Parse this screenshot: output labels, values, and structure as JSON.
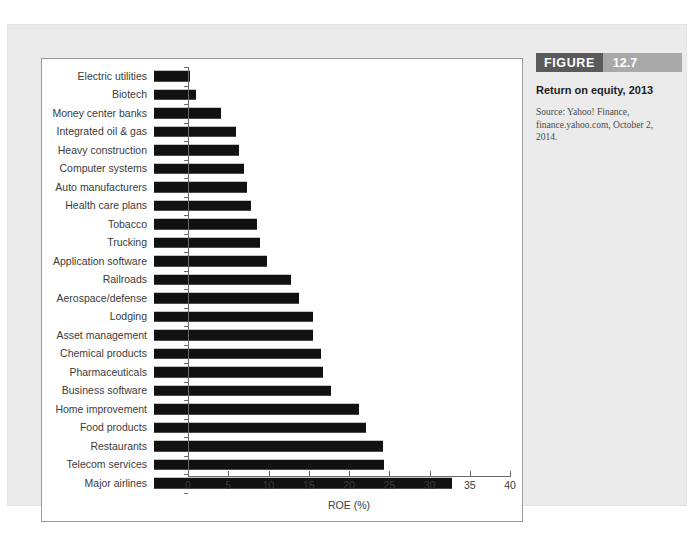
{
  "page": {
    "header_bleed": "",
    "folio": ""
  },
  "caption": {
    "badge_word": "FIGURE",
    "badge_number": "12.7",
    "title": "Return on equity, 2013",
    "source": "Source: Yahoo! Finance, finance.yahoo.com, October 2, 2014."
  },
  "colors": {
    "bar": "#111111",
    "panel_bg": "#ebebeb",
    "card_bg": "#ffffff",
    "badge_word_bg": "#5a5a5a",
    "badge_num_bg": "#a9a9a9",
    "axis": "#6a6a6a",
    "text": "#3b3b3b"
  },
  "chart_data": {
    "type": "bar",
    "orientation": "horizontal",
    "title": "Return on equity, 2013",
    "xlabel": "ROE (%)",
    "ylabel": "",
    "xlim": [
      0,
      40
    ],
    "xticks": [
      0,
      5,
      10,
      15,
      20,
      25,
      30,
      35,
      40
    ],
    "grid": false,
    "legend": false,
    "categories": [
      "Electric utilities",
      "Biotech",
      "Money center banks",
      "Integrated oil & gas",
      "Heavy construction",
      "Computer systems",
      "Auto manufacturers",
      "Health care plans",
      "Tobacco",
      "Trucking",
      "Application software",
      "Railroads",
      "Aerospace/defense",
      "Lodging",
      "Asset management",
      "Chemical products",
      "Pharmaceuticals",
      "Business software",
      "Home improvement",
      "Food products",
      "Restaurants",
      "Telecom services",
      "Major airlines"
    ],
    "values": [
      4.5,
      5.2,
      8.3,
      10.2,
      10.5,
      11.2,
      11.6,
      12.0,
      12.8,
      13.2,
      14.0,
      17.0,
      18.0,
      19.8,
      19.8,
      20.8,
      21.0,
      22.0,
      25.5,
      26.3,
      28.5,
      28.6,
      37.0
    ]
  }
}
